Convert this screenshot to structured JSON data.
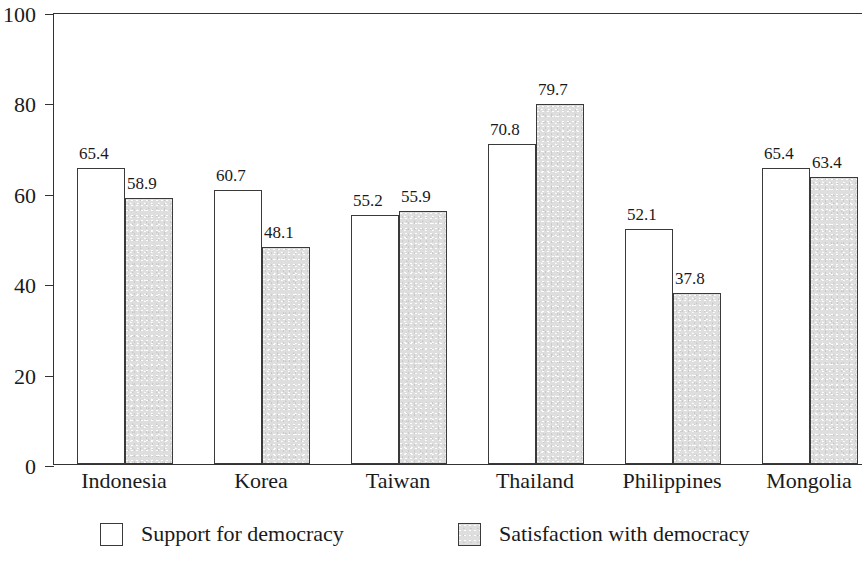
{
  "chart_data": {
    "type": "bar",
    "title": "",
    "subtitle": "",
    "xlabel": "",
    "ylabel": "",
    "ylim": [
      0,
      100
    ],
    "yticks": [
      0,
      20,
      40,
      60,
      80,
      100
    ],
    "grid": false,
    "legend_position": "bottom",
    "categories": [
      "Indonesia",
      "Korea",
      "Taiwan",
      "Thailand",
      "Philippines",
      "Mongolia"
    ],
    "series": [
      {
        "name": "Support for democracy",
        "color": "#ffffff",
        "values": [
          65.4,
          60.7,
          55.2,
          70.8,
          52.1,
          65.4
        ],
        "labels": [
          "65.4",
          "60.7",
          "55.2",
          "70.8",
          "52.1",
          "65.4"
        ]
      },
      {
        "name": "Satisfaction with democracy",
        "color": "#dedede",
        "values": [
          58.9,
          48.1,
          55.9,
          79.7,
          37.8,
          63.4
        ],
        "labels": [
          "58.9",
          "48.1",
          "55.9",
          "79.7",
          "37.8",
          "63.4"
        ]
      }
    ],
    "ytick_labels": [
      "0",
      "20",
      "40",
      "60",
      "80",
      "100"
    ]
  },
  "legend": {
    "items": [
      {
        "label": "Support for democracy",
        "swatch": "white-square-swatch"
      },
      {
        "label": "Satisfaction with democracy",
        "swatch": "gray-square-swatch"
      }
    ]
  }
}
